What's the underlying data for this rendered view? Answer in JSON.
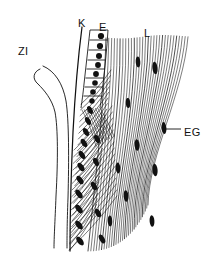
{
  "figure": {
    "kind": "histology-line-drawing",
    "title": "",
    "background_color": "#ffffff",
    "ink_color": "#111111",
    "width": 210,
    "height": 258,
    "labels": [
      {
        "id": "ZI",
        "text": "ZI",
        "x": 18,
        "y": 52,
        "leader": false
      },
      {
        "id": "K",
        "text": "K",
        "x": 78,
        "y": 24,
        "leader": false
      },
      {
        "id": "E",
        "text": "E",
        "x": 99,
        "y": 28,
        "leader": false
      },
      {
        "id": "L",
        "text": "L",
        "x": 144,
        "y": 34,
        "leader": false
      },
      {
        "id": "EG",
        "text": "EG",
        "x": 184,
        "y": 133,
        "leader": true,
        "leader_from": [
          181,
          129
        ],
        "leader_to": [
          166,
          129
        ]
      }
    ],
    "structures": {
      "zi_tube": {
        "name": "tapering tube",
        "outer": "M 40 69 C 33 72 32 79 38 84 C 44 90 52 99 55 112 C 58 128 58 160 56 196 C 55 222 54 238 54 247",
        "inner": "M 44 67 C 56 72 63 84 66 101 C 69 120 69 160 68 198 C 67 224 67 240 67 247"
      },
      "k_line": {
        "name": "cuticle-boundary-line",
        "path": "M 81 27 C 77 60 74 96 72 134 C 70 176 69 215 69 250"
      },
      "epithelium": {
        "name": "palisade-epithelial-cells",
        "cell_count": 8,
        "top_y": 30,
        "bottom_y": 108,
        "nucleus_shape": "round"
      },
      "oblique_layer": {
        "name": "obliquely-striated-layer",
        "line_count": 26,
        "nucleus_shape": "elongate-oblique"
      },
      "fibre_layer": {
        "name": "longitudinal-fibre-layer",
        "line_count": 30,
        "nucleus_shape": "elongate-vertical"
      }
    },
    "nuclei": {
      "epithelial_round": [
        {
          "cx": 101,
          "cy": 36,
          "r": 3.1
        },
        {
          "cx": 100,
          "cy": 46,
          "r": 3.1
        },
        {
          "cx": 99,
          "cy": 56,
          "r": 3.0
        },
        {
          "cx": 98,
          "cy": 65,
          "r": 2.9
        },
        {
          "cx": 96,
          "cy": 74,
          "r": 2.9
        },
        {
          "cx": 95,
          "cy": 83,
          "r": 2.8
        },
        {
          "cx": 93,
          "cy": 92,
          "r": 2.8
        },
        {
          "cx": 92,
          "cy": 101,
          "r": 2.7
        }
      ],
      "oblique_elongate": [
        {
          "cx": 90,
          "cy": 110,
          "rx": 2.4,
          "ry": 4.2,
          "rot": -28
        },
        {
          "cx": 88,
          "cy": 121,
          "rx": 2.4,
          "ry": 4.4,
          "rot": -30
        },
        {
          "cx": 86,
          "cy": 132,
          "rx": 2.5,
          "ry": 4.4,
          "rot": -30
        },
        {
          "cx": 84,
          "cy": 143,
          "rx": 2.5,
          "ry": 4.6,
          "rot": -32
        },
        {
          "cx": 82,
          "cy": 155,
          "rx": 2.5,
          "ry": 4.6,
          "rot": -33
        },
        {
          "cx": 81,
          "cy": 167,
          "rx": 2.6,
          "ry": 4.8,
          "rot": -34
        },
        {
          "cx": 80,
          "cy": 180,
          "rx": 2.6,
          "ry": 4.8,
          "rot": -35
        },
        {
          "cx": 79,
          "cy": 194,
          "rx": 2.6,
          "ry": 5.0,
          "rot": -36
        },
        {
          "cx": 79,
          "cy": 209,
          "rx": 2.7,
          "ry": 5.0,
          "rot": -37
        },
        {
          "cx": 79,
          "cy": 225,
          "rx": 2.7,
          "ry": 5.2,
          "rot": -38
        },
        {
          "cx": 80,
          "cy": 241,
          "rx": 2.7,
          "ry": 5.2,
          "rot": -38
        },
        {
          "cx": 97,
          "cy": 139,
          "rx": 2.4,
          "ry": 4.4,
          "rot": -26
        },
        {
          "cx": 96,
          "cy": 162,
          "rx": 2.4,
          "ry": 4.4,
          "rot": -26
        },
        {
          "cx": 94,
          "cy": 186,
          "rx": 2.5,
          "ry": 4.6,
          "rot": -28
        },
        {
          "cx": 98,
          "cy": 213,
          "rx": 2.5,
          "ry": 4.6,
          "rot": -28
        },
        {
          "cx": 102,
          "cy": 239,
          "rx": 2.5,
          "ry": 4.8,
          "rot": -30
        }
      ],
      "fibre_elongate": [
        {
          "cx": 138,
          "cy": 62,
          "rx": 2.3,
          "ry": 5.4,
          "rot": -4
        },
        {
          "cx": 155,
          "cy": 68,
          "rx": 2.6,
          "ry": 6.2,
          "rot": -6
        },
        {
          "cx": 164,
          "cy": 128,
          "rx": 2.4,
          "ry": 6.0,
          "rot": -5
        },
        {
          "cx": 137,
          "cy": 145,
          "rx": 2.4,
          "ry": 5.8,
          "rot": -4
        },
        {
          "cx": 155,
          "cy": 170,
          "rx": 2.6,
          "ry": 6.2,
          "rot": -5
        },
        {
          "cx": 118,
          "cy": 168,
          "rx": 2.3,
          "ry": 5.4,
          "rot": -4
        },
        {
          "cx": 126,
          "cy": 196,
          "rx": 2.4,
          "ry": 5.8,
          "rot": -4
        },
        {
          "cx": 152,
          "cy": 221,
          "rx": 2.4,
          "ry": 5.8,
          "rot": -4
        },
        {
          "cx": 110,
          "cy": 221,
          "rx": 2.3,
          "ry": 5.4,
          "rot": -3
        },
        {
          "cx": 128,
          "cy": 103,
          "rx": 2.2,
          "ry": 5.0,
          "rot": -3
        }
      ]
    }
  }
}
